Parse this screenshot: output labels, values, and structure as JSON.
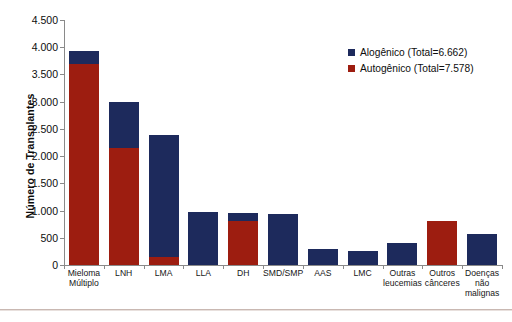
{
  "chart_data": {
    "type": "bar",
    "title": "",
    "subtitle": "",
    "xlabel": "",
    "ylabel": "Número de Transplantes",
    "ylim": [
      0,
      4500
    ],
    "ytick_labels": [
      "0",
      "500",
      "1.000",
      "1.500",
      "2.000",
      "2.500",
      "3.000",
      "3.500",
      "4.000",
      "4.500"
    ],
    "ytick_values": [
      0,
      500,
      1000,
      1500,
      2000,
      2500,
      3000,
      3500,
      4000,
      4500
    ],
    "grid": false,
    "stacked": true,
    "legend_position": "top-right",
    "categories": [
      "Mieloma\nMúltiplo",
      "LNH",
      "LMA",
      "LLA",
      "DH",
      "SMD/SMP",
      "AAS",
      "LMC",
      "Outras\nleucemias",
      "Outros\ncânceres",
      "Doenças\nnão\nmalignas"
    ],
    "series": [
      {
        "name": "Autogênico (Total=7.578)",
        "color": "#9d1d10",
        "values": [
          3700,
          2150,
          150,
          0,
          800,
          0,
          0,
          0,
          0,
          810,
          0
        ]
      },
      {
        "name": "Alogênico (Total=6.662)",
        "color": "#1d2a5c",
        "values": [
          230,
          850,
          2240,
          970,
          150,
          940,
          290,
          250,
          400,
          0,
          570
        ]
      }
    ],
    "totals": [
      3930,
      3000,
      2390,
      970,
      950,
      940,
      290,
      250,
      400,
      810,
      570
    ]
  },
  "legend": {
    "items": [
      {
        "label": "Alogênico (Total=6.662)",
        "color": "#1d2a5c"
      },
      {
        "label": "Autogênico (Total=7.578)",
        "color": "#9d1d10"
      }
    ]
  }
}
